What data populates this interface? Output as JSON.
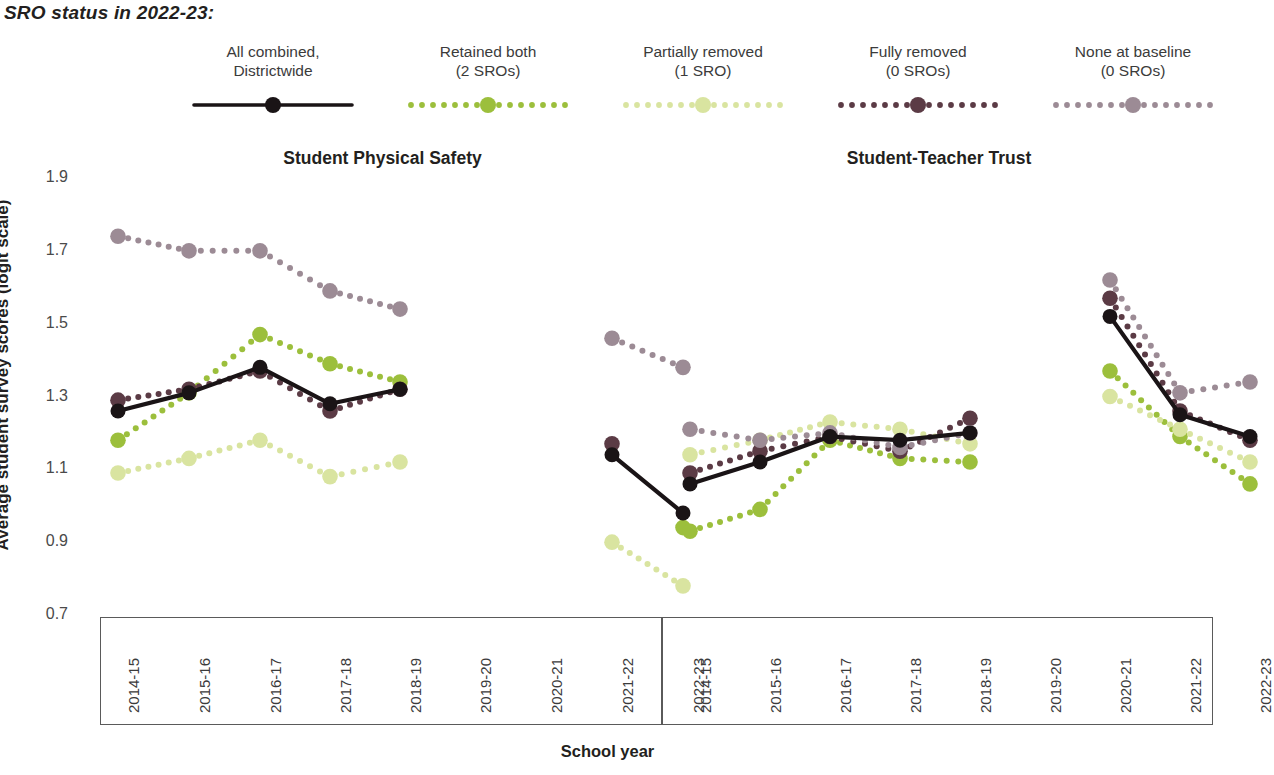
{
  "legend": {
    "title": "SRO status in 2022-23:",
    "items": [
      {
        "label": "All combined,\nDistrictwide",
        "style": "solid",
        "color": "#1a1416",
        "key": "all_combined"
      },
      {
        "label": "Retained both\n(2 SROs)",
        "style": "dotted",
        "color": "#9CBF3C",
        "key": "retained_both"
      },
      {
        "label": "Partially removed\n(1 SRO)",
        "style": "dotted",
        "color": "#D9E4A0",
        "key": "partially_removed"
      },
      {
        "label": "Fully removed\n(0 SROs)",
        "style": "dotted",
        "color": "#5B3B45",
        "key": "fully_removed"
      },
      {
        "label": "None at baseline\n(0 SROs)",
        "style": "dotted",
        "color": "#9C8B95",
        "key": "none_at_baseline"
      }
    ]
  },
  "axis": {
    "ylabel": "Average student survey scores (logit scale)",
    "xlabel": "School year",
    "yticks": [
      "1.9",
      "1.7",
      "1.5",
      "1.3",
      "1.1",
      "0.9",
      "0.7"
    ],
    "ymin": 0.7,
    "ymax": 1.9
  },
  "chart_data": [
    {
      "type": "line",
      "title": "Student Physical Safety",
      "xlabel": "School year",
      "ylabel": "Average student survey scores (logit scale)",
      "ylim": [
        0.7,
        1.9
      ],
      "grid": false,
      "legend_position": "top",
      "categories": [
        "2014-15",
        "2015-16",
        "2016-17",
        "2017-18",
        "2018-19",
        "2019-20",
        "2020-21",
        "2021-22",
        "2022-23"
      ],
      "series": [
        {
          "name": "All combined, Districtwide",
          "color": "#1a1416",
          "style": "solid",
          "values": [
            1.26,
            1.31,
            1.38,
            1.28,
            1.32,
            null,
            null,
            1.14,
            0.98
          ]
        },
        {
          "name": "Retained both (2 SROs)",
          "color": "#9CBF3C",
          "style": "dotted",
          "values": [
            1.18,
            1.31,
            1.47,
            1.39,
            1.34,
            null,
            null,
            null,
            0.94
          ]
        },
        {
          "name": "Partially removed (1 SRO)",
          "color": "#D9E4A0",
          "style": "dotted",
          "values": [
            1.09,
            1.13,
            1.18,
            1.08,
            1.12,
            null,
            null,
            0.9,
            0.78
          ]
        },
        {
          "name": "Fully removed (0 SROs)",
          "color": "#5B3B45",
          "style": "dotted",
          "values": [
            1.29,
            1.32,
            1.37,
            1.26,
            1.32,
            null,
            null,
            1.17,
            null
          ]
        },
        {
          "name": "None at baseline (0 SROs)",
          "color": "#9C8B95",
          "style": "dotted",
          "values": [
            1.74,
            1.7,
            1.7,
            1.59,
            1.54,
            null,
            null,
            1.46,
            1.38
          ]
        }
      ]
    },
    {
      "type": "line",
      "title": "Student-Teacher Trust",
      "xlabel": "School year",
      "ylabel": "Average student survey scores (logit scale)",
      "ylim": [
        0.7,
        1.9
      ],
      "grid": false,
      "legend_position": "top",
      "categories": [
        "2014-15",
        "2015-16",
        "2016-17",
        "2017-18",
        "2018-19",
        "2019-20",
        "2020-21",
        "2021-22",
        "2022-23"
      ],
      "series": [
        {
          "name": "All combined, Districtwide",
          "color": "#1a1416",
          "style": "solid",
          "values": [
            1.06,
            1.12,
            1.19,
            1.18,
            1.2,
            null,
            1.52,
            1.25,
            1.19
          ]
        },
        {
          "name": "Retained both (2 SROs)",
          "color": "#9CBF3C",
          "style": "dotted",
          "values": [
            0.93,
            0.99,
            1.18,
            1.13,
            1.12,
            null,
            1.37,
            1.19,
            1.06
          ]
        },
        {
          "name": "Partially removed (1 SRO)",
          "color": "#D9E4A0",
          "style": "dotted",
          "values": [
            1.14,
            1.18,
            1.23,
            1.21,
            1.17,
            null,
            1.3,
            1.21,
            1.12
          ]
        },
        {
          "name": "Fully removed (0 SROs)",
          "color": "#5B3B45",
          "style": "dotted",
          "values": [
            1.09,
            1.15,
            1.19,
            1.15,
            1.24,
            null,
            1.57,
            1.26,
            1.18
          ]
        },
        {
          "name": "None at baseline (0 SROs)",
          "color": "#9C8B95",
          "style": "dotted",
          "values": [
            1.21,
            1.18,
            1.2,
            1.16,
            1.2,
            null,
            1.62,
            1.31,
            1.34
          ]
        }
      ]
    }
  ]
}
